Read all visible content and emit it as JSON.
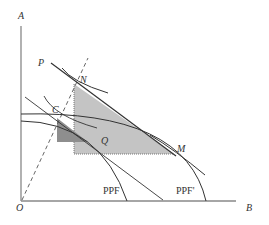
{
  "diagram": {
    "axes": {
      "y_label": "A",
      "x_label": "B",
      "origin_label": "O"
    },
    "points": {
      "P": "P",
      "N": "N",
      "C": "C",
      "Q": "Q",
      "M": "M"
    },
    "curves": {
      "ppf": "PPF",
      "ppf_prime": "PPF'"
    },
    "colors": {
      "axis": "#888888",
      "curve": "#333333",
      "light_fill": "#c8c8c8",
      "dark_fill": "#8a8a8a"
    }
  }
}
